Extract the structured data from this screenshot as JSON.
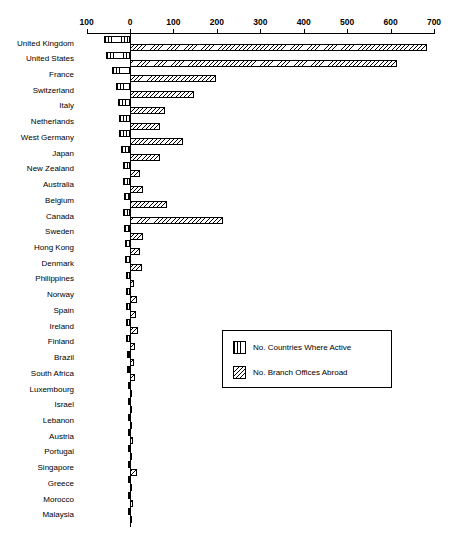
{
  "chart_data": {
    "type": "bar",
    "orientation": "horizontal",
    "style": "bidirectional-paired-bars",
    "title": "",
    "subtitle": "",
    "xlabel": "",
    "ylabel": "",
    "xlim": [
      -100,
      700
    ],
    "xticks": [
      -100,
      0,
      100,
      200,
      300,
      400,
      500,
      600,
      700
    ],
    "xticklabels": [
      "100",
      "0",
      "100",
      "200",
      "300",
      "400",
      "500",
      "600",
      "700"
    ],
    "grid": false,
    "axis_position": "top",
    "legend_position": "center-right",
    "categories": [
      "United Kingdom",
      "United States",
      "France",
      "Switzerland",
      "Italy",
      "Netherlands",
      "West Germany",
      "Japan",
      "New Zealand",
      "Australia",
      "Belgium",
      "Canada",
      "Sweden",
      "Hong Kong",
      "Denmark",
      "Philippines",
      "Norway",
      "Spain",
      "Ireland",
      "Finland",
      "Brazil",
      "South Africa",
      "Luxembourg",
      "Israel",
      "Lebanon",
      "Austria",
      "Portugal",
      "Singapore",
      "Greece",
      "Morocco",
      "Malaysia"
    ],
    "series": [
      {
        "name": "No. Countries Where Active",
        "direction": "left",
        "hatch": "vertical-lines",
        "values": [
          60,
          55,
          42,
          33,
          28,
          26,
          26,
          20,
          16,
          15,
          14,
          16,
          13,
          12,
          11,
          9,
          10,
          9,
          9,
          9,
          8,
          7,
          4,
          3,
          4,
          5,
          4,
          5,
          3,
          3,
          4
        ]
      },
      {
        "name": "No. Branch Offices Abroad",
        "direction": "right",
        "hatch": "diagonal-lines",
        "values": [
          685,
          615,
          198,
          148,
          80,
          70,
          122,
          68,
          24,
          30,
          85,
          215,
          30,
          22,
          28,
          9,
          16,
          14,
          18,
          12,
          10,
          12,
          4,
          3,
          5,
          8,
          5,
          17,
          4,
          6,
          4
        ]
      }
    ],
    "legend_entries": [
      "No. Countries Where Active",
      "No. Branch Offices Abroad"
    ]
  },
  "colors": {
    "ink": "#000000",
    "background": "#ffffff"
  }
}
